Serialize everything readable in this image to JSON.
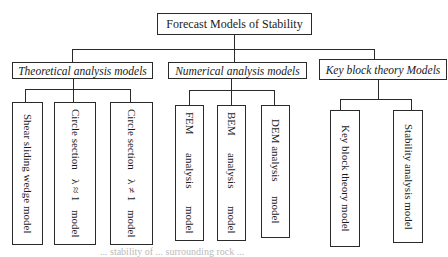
{
  "diagram": {
    "type": "hierarchy-tree",
    "root": {
      "label": "Forecast Models of Stability"
    },
    "categories": [
      {
        "label": "Theoretical analysis models",
        "children": [
          {
            "lines": [
              "Shear sliding wedge model"
            ]
          },
          {
            "lines": [
              "Circle section",
              "λ ≈ 1",
              "model"
            ]
          },
          {
            "lines": [
              "Circle section",
              "λ ≠ 1",
              "model"
            ]
          }
        ]
      },
      {
        "label": "Numerical analysis models",
        "children": [
          {
            "lines": [
              "FEM",
              "analysis",
              "model"
            ]
          },
          {
            "lines": [
              "BEM",
              "analysis",
              "model"
            ]
          },
          {
            "lines": [
              "DEM analysis",
              "model"
            ]
          }
        ]
      },
      {
        "label": "Key block theory Models",
        "children": [
          {
            "lines": [
              "Key block theory model"
            ]
          },
          {
            "lines": [
              "Stability analysis model"
            ]
          }
        ]
      }
    ],
    "caption": "... stability of ... surrounding rock ..."
  }
}
